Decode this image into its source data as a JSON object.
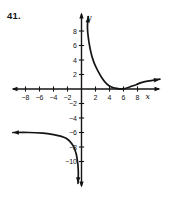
{
  "figure": {
    "problem_number": "41.",
    "background": "#ffffff",
    "ink": "#141414"
  },
  "chart_data": {
    "type": "line",
    "xlabel": "x",
    "ylabel": "y",
    "xlim": [
      -10,
      11.5
    ],
    "ylim": [
      -13.5,
      10.5
    ],
    "grid": false,
    "axes_through_origin": true,
    "x_ticks": [
      -8,
      -6,
      -4,
      -2,
      2,
      4,
      6,
      8
    ],
    "x_tick_labels": [
      "−8",
      "−6",
      "−4",
      "−2",
      "2",
      "4",
      "6",
      "8"
    ],
    "y_ticks": [
      8,
      6,
      4,
      2,
      -2,
      -4,
      -6,
      -8,
      -10
    ],
    "y_tick_labels": [
      "8",
      "6",
      "4",
      "2",
      "−2",
      "−4",
      "−6",
      "−8",
      "−10"
    ],
    "series": [
      {
        "name": "branch-upper-right",
        "arrow_start": true,
        "arrow_end": true,
        "points": [
          [
            0.95,
            10
          ],
          [
            0.85,
            8.3
          ],
          [
            1.05,
            6.6
          ],
          [
            1.35,
            5.0
          ],
          [
            1.8,
            3.6
          ],
          [
            2.4,
            2.4
          ],
          [
            3.0,
            1.4
          ],
          [
            3.6,
            0.7
          ],
          [
            4.2,
            0.3
          ],
          [
            5.0,
            0.08
          ],
          [
            6.0,
            0.02
          ],
          [
            6.8,
            0.25
          ],
          [
            7.8,
            0.6
          ],
          [
            8.8,
            0.95
          ],
          [
            11.2,
            1.35
          ]
        ]
      },
      {
        "name": "branch-lower-left",
        "arrow_start": true,
        "arrow_end": true,
        "points": [
          [
            -9.8,
            -6.0
          ],
          [
            -7.5,
            -6.0
          ],
          [
            -5.5,
            -6.1
          ],
          [
            -4.0,
            -6.3
          ],
          [
            -3.0,
            -6.5
          ],
          [
            -2.2,
            -6.8
          ],
          [
            -1.6,
            -7.3
          ],
          [
            -1.1,
            -8.0
          ],
          [
            -0.75,
            -9.0
          ],
          [
            -0.55,
            -10.2
          ],
          [
            -0.45,
            -11.4
          ],
          [
            -0.5,
            -13.0
          ]
        ]
      }
    ]
  }
}
